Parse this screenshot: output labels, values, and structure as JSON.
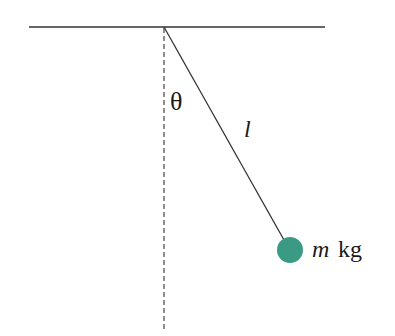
{
  "diagram": {
    "type": "simple-pendulum",
    "labels": {
      "angle": "θ",
      "length": "l",
      "mass_var": "m",
      "mass_unit": "kg"
    },
    "colors": {
      "line": "#333333",
      "bob": "#3a9a84",
      "text": "#1a1a1a"
    }
  }
}
